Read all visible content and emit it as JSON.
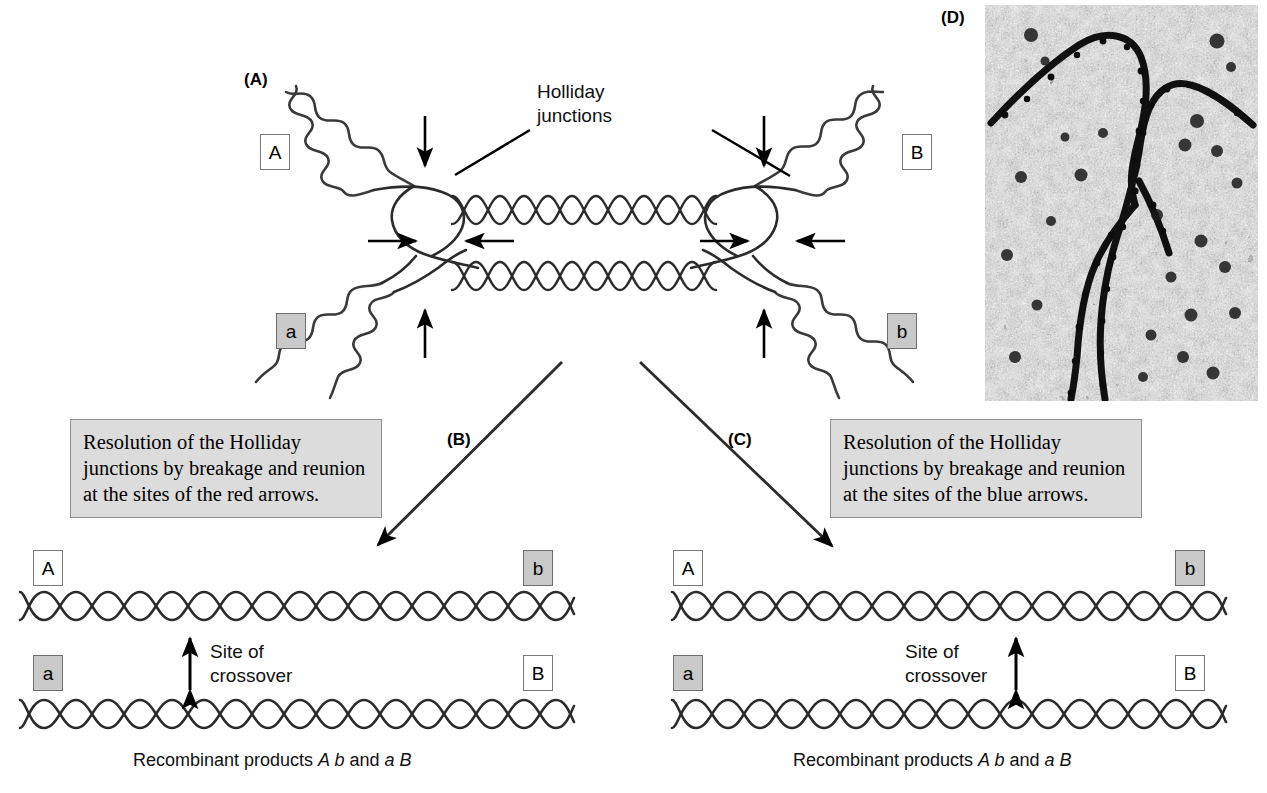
{
  "figure": {
    "background": "#ffffff"
  },
  "panels": {
    "a": {
      "letter": "(A)",
      "junction_label": "Holliday\njunctions",
      "alleles": {
        "top_left": "A",
        "top_right": "B",
        "bottom_left": "a",
        "bottom_right": "b"
      }
    },
    "b": {
      "letter": "(B)",
      "box_text": "Resolution of the Holliday junctions by breakage and reunion at the sites of the red arrows.",
      "crossover_label": "Site of\ncrossover",
      "alleles": {
        "top_left": "A",
        "top_right": "b",
        "bottom_left": "a",
        "bottom_right": "B"
      },
      "caption_prefix": "Recombinant products ",
      "caption_gene1": "A b",
      "caption_middle": " and ",
      "caption_gene2": "a B"
    },
    "c": {
      "letter": "(C)",
      "box_text": "Resolution of the Holliday junctions by breakage and reunion at the sites of the blue arrows.",
      "crossover_label": "Site of\ncrossover",
      "alleles": {
        "top_left": "A",
        "top_right": "b",
        "bottom_left": "a",
        "bottom_right": "B"
      },
      "caption_prefix": "Recombinant products ",
      "caption_gene1": "A b",
      "caption_middle": " and ",
      "caption_gene2": "a B"
    },
    "d": {
      "letter": "(D)",
      "description": "electron micrograph of a chi-form Holliday junction"
    }
  },
  "colors": {
    "dna_strand": "#2b2b2b",
    "arrow": "#000000",
    "allele_dominant_fill": "#ffffff",
    "allele_recessive_fill": "#c9c9c9",
    "allele_border": "#7a7a7a",
    "grey_box_fill": "#dcdcdc",
    "grey_box_border": "#8f8f8f",
    "micrograph_base": "#b9b9b9"
  },
  "icons": {
    "vertical_arrow": "down-arrow-icon",
    "horizontal_arrow": "horizontal-arrow-icon",
    "double_arrow": "double-headed-arrow-icon",
    "flow_arrow": "flow-arrow-icon"
  }
}
